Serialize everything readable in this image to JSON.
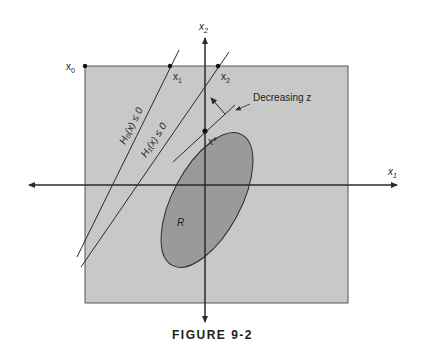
{
  "figure": {
    "caption": "FIGURE 9-2",
    "axes": {
      "horizontal_label": "x",
      "horizontal_sub": "1",
      "vertical_label": "x",
      "vertical_sub": "2"
    },
    "points": {
      "x0": {
        "label": "x",
        "sub": "0"
      },
      "x1": {
        "label": "x",
        "sub": "1"
      },
      "x2": {
        "label": "x",
        "sub": "2"
      },
      "xstar": {
        "label": "x*"
      }
    },
    "constraints": {
      "h0": "H₀(x) ≤ 0",
      "h1": "H₁(x) ≤ 0"
    },
    "region_label": "R",
    "objective_label": "Decreasing z",
    "colors": {
      "feasible_square": "#c8c8c8",
      "region_R": "#9a9a9a",
      "lines": "#2a2a2a"
    }
  }
}
